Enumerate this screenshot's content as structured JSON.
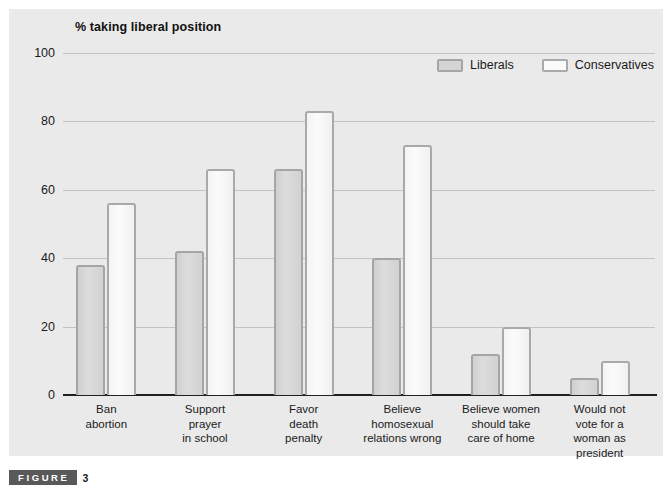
{
  "figure": {
    "word": "FIGURE",
    "number": "3"
  },
  "chart_data": {
    "type": "bar",
    "title": "% taking liberal position",
    "xlabel": "",
    "ylabel": "% taking liberal position",
    "ylim": [
      0,
      100
    ],
    "yticks": [
      0,
      20,
      40,
      60,
      80,
      100
    ],
    "ytick_labels": [
      "0",
      "20",
      "40",
      "60",
      "80",
      "100"
    ],
    "grid": true,
    "legend_position": "top-right",
    "categories": [
      "Ban\nabortion",
      "Support\nprayer\nin school",
      "Favor\ndeath\npenalty",
      "Believe\nhomosexual\nrelations wrong",
      "Believe women\nshould take\ncare of home",
      "Would not\nvote for a\nwoman as\npresident"
    ],
    "category_lines": [
      [
        "Ban",
        "abortion"
      ],
      [
        "Support",
        "prayer",
        "in school"
      ],
      [
        "Favor",
        "death",
        "penalty"
      ],
      [
        "Believe",
        "homosexual",
        "relations wrong"
      ],
      [
        "Believe women",
        "should take",
        "care of home"
      ],
      [
        "Would not",
        "vote for a",
        "woman as",
        "president"
      ]
    ],
    "series": [
      {
        "name": "Liberals",
        "color": "#d4d4d4",
        "border_color": "#a5a5a5",
        "values": [
          38,
          42,
          66,
          40,
          12,
          5
        ]
      },
      {
        "name": "Conservatives",
        "color": "#fbfbfb",
        "border_color": "#a9a9a9",
        "values": [
          56,
          66,
          83,
          73,
          20,
          10
        ]
      }
    ]
  },
  "legend": {
    "entries": [
      {
        "label": "Liberals",
        "swatch": "liberals"
      },
      {
        "label": "Conservatives",
        "swatch": "conservatives"
      }
    ]
  },
  "colors": {
    "panel_background": "#eaeaea",
    "page_background": "#ffffff",
    "gridline": "#c3c3c3",
    "axis": "#231f20",
    "text": "#1a1a1a",
    "caption_box": "#595959"
  }
}
